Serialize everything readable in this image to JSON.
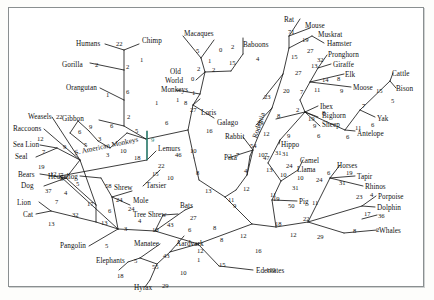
{
  "figure": {
    "kind": "phylogenetic-tree",
    "background": "#ffffff",
    "border_color": "#8a8f90",
    "line_color": "#1a1a1a",
    "highlight_color": "#2e8b7a"
  },
  "chart_data": {
    "type": "diagram",
    "subtype": "phylogram",
    "taxa": [
      "Humans",
      "Chimp",
      "Gorilla",
      "Orangutan",
      "Gibbon",
      "Macaques",
      "Baboons",
      "Old World Monkeys",
      "S. American Monkeys",
      "Loris",
      "Galago",
      "Lemurs",
      "Tarsier",
      "Rabbit",
      "Pika",
      "Rat",
      "Mouse",
      "Muskrat",
      "Hamster",
      "Weasels",
      "Raccoons",
      "Sea Lion",
      "Seal",
      "Bears",
      "Dog",
      "Lion",
      "Cat",
      "Hedgehog",
      "Shrew",
      "Mole",
      "Tree Shrew",
      "Bats",
      "Pangolin",
      "Manatee",
      "Aardvark",
      "Elephants",
      "Hyrax",
      "Edentates",
      "Pronghorn",
      "Giraffe",
      "Elk",
      "Moose",
      "Ibex",
      "Bighorn Sheep",
      "Antelope",
      "Cattle",
      "Bison",
      "Yak",
      "Hippo",
      "Camel",
      "Llama",
      "Pig",
      "Horses",
      "Tapir",
      "Rhinos",
      "Porpoise",
      "Dolphin",
      "Whales"
    ],
    "clade_labels": [
      "Rodentia"
    ],
    "branch_lengths": [
      22,
      1,
      2,
      2,
      6,
      1,
      2,
      6,
      5,
      5,
      0,
      1,
      2,
      2,
      15,
      4,
      0,
      1,
      1,
      8,
      27,
      16,
      6,
      10,
      46,
      22,
      18,
      15,
      10,
      54,
      7,
      107,
      4,
      13,
      8,
      9,
      11,
      12,
      29,
      23,
      20,
      71,
      19,
      15,
      27,
      27,
      32,
      13,
      14,
      8,
      9,
      11,
      7,
      2,
      19,
      8,
      9,
      6,
      6,
      11,
      7,
      15,
      5,
      6,
      47,
      31,
      24,
      10,
      31,
      6,
      19,
      31,
      10,
      23,
      4,
      17,
      36,
      2,
      8,
      29,
      22,
      11,
      24,
      50,
      12,
      18,
      12,
      16,
      110,
      12,
      5,
      55,
      18,
      43,
      29,
      10,
      1,
      12,
      15,
      43,
      27,
      6,
      8,
      10,
      4,
      3,
      13,
      24,
      24,
      58,
      6,
      5,
      17,
      32,
      13,
      7,
      37,
      19,
      12,
      7,
      9,
      5,
      3,
      9,
      6,
      5,
      3,
      10,
      5,
      9,
      12,
      22,
      6,
      1,
      5,
      41
    ]
  },
  "labels": [
    {
      "id": "humans",
      "text": "Humans",
      "x": 76,
      "y": 41
    },
    {
      "id": "chimp",
      "text": "Chimp",
      "x": 142,
      "y": 38
    },
    {
      "id": "macaques",
      "text": "Macaques",
      "x": 184,
      "y": 31
    },
    {
      "id": "baboons",
      "text": "Baboons",
      "x": 243,
      "y": 42
    },
    {
      "id": "gorilla",
      "text": "Gorilla",
      "x": 62,
      "y": 62
    },
    {
      "id": "orangutan",
      "text": "Orangutan",
      "x": 66,
      "y": 85
    },
    {
      "id": "old",
      "text": "Old",
      "x": 170,
      "y": 69
    },
    {
      "id": "world",
      "text": "World",
      "x": 165,
      "y": 78
    },
    {
      "id": "monkeys",
      "text": "Monkeys",
      "x": 161,
      "y": 87
    },
    {
      "id": "gibbon",
      "text": "Gibbon",
      "x": 62,
      "y": 116
    },
    {
      "id": "loris",
      "text": "Loris",
      "x": 201,
      "y": 110
    },
    {
      "id": "galago",
      "text": "Galago",
      "x": 217,
      "y": 120
    },
    {
      "id": "rabbit",
      "text": "Rabbit",
      "x": 225,
      "y": 134
    },
    {
      "id": "pika",
      "text": "Pika",
      "x": 224,
      "y": 155
    },
    {
      "id": "weasels",
      "text": "Weasels",
      "x": 28,
      "y": 114
    },
    {
      "id": "raccoons",
      "text": "Raccoons",
      "x": 13,
      "y": 126
    },
    {
      "id": "sealion",
      "text": "Sea Lion",
      "x": 13,
      "y": 142
    },
    {
      "id": "seal",
      "text": "Seal",
      "x": 15,
      "y": 154
    },
    {
      "id": "bears",
      "text": "Bears",
      "x": 18,
      "y": 172
    },
    {
      "id": "dog",
      "text": "Dog",
      "x": 21,
      "y": 183
    },
    {
      "id": "lion",
      "text": "Lion",
      "x": 17,
      "y": 200
    },
    {
      "id": "cat",
      "text": "Cat",
      "x": 23,
      "y": 212
    },
    {
      "id": "samonkeys",
      "text": "S. American Monkeys",
      "x": 74,
      "y": 150,
      "rotate": -12
    },
    {
      "id": "lemurs",
      "text": "Lemurs",
      "x": 158,
      "y": 146
    },
    {
      "id": "tarsier",
      "text": "Tarsier",
      "x": 146,
      "y": 183
    },
    {
      "id": "hedgehog",
      "text": "Hedgehog",
      "x": 48,
      "y": 174
    },
    {
      "id": "shrew",
      "text": "Shrew",
      "x": 114,
      "y": 185
    },
    {
      "id": "mole",
      "text": "Mole",
      "x": 133,
      "y": 198
    },
    {
      "id": "treeshrew",
      "text": "Tree Shrew",
      "x": 133,
      "y": 212
    },
    {
      "id": "bats",
      "text": "Bats",
      "x": 180,
      "y": 203
    },
    {
      "id": "pangolin",
      "text": "Pangolin",
      "x": 60,
      "y": 243
    },
    {
      "id": "manatee",
      "text": "Manatee",
      "x": 134,
      "y": 241
    },
    {
      "id": "aardvark",
      "text": "Aardvark",
      "x": 176,
      "y": 241
    },
    {
      "id": "elephants",
      "text": "Elephants",
      "x": 96,
      "y": 258
    },
    {
      "id": "hyrax",
      "text": "Hyrax",
      "x": 134,
      "y": 285
    },
    {
      "id": "edentates",
      "text": "Edentates",
      "x": 256,
      "y": 268
    },
    {
      "id": "rodentia",
      "text": "Rodentia",
      "x": 252,
      "y": 137,
      "rotate": -72
    },
    {
      "id": "rat",
      "text": "Rat",
      "x": 284,
      "y": 17
    },
    {
      "id": "mouse",
      "text": "Mouse",
      "x": 305,
      "y": 23
    },
    {
      "id": "muskrat",
      "text": "Muskrat",
      "x": 318,
      "y": 32
    },
    {
      "id": "hamster",
      "text": "Hamster",
      "x": 327,
      "y": 41
    },
    {
      "id": "pronghorn",
      "text": "Pronghorn",
      "x": 328,
      "y": 52
    },
    {
      "id": "giraffe",
      "text": "Giraffe",
      "x": 333,
      "y": 62
    },
    {
      "id": "elk",
      "text": "Elk",
      "x": 345,
      "y": 72
    },
    {
      "id": "moose",
      "text": "Moose",
      "x": 353,
      "y": 85
    },
    {
      "id": "cattle",
      "text": "Cattle",
      "x": 392,
      "y": 71
    },
    {
      "id": "bison",
      "text": "Bison",
      "x": 396,
      "y": 86
    },
    {
      "id": "ibex",
      "text": "Ibex",
      "x": 320,
      "y": 104
    },
    {
      "id": "bighorn",
      "text": "Bighorn",
      "x": 322,
      "y": 113
    },
    {
      "id": "sheep",
      "text": "Sheep",
      "x": 322,
      "y": 122
    },
    {
      "id": "yak",
      "text": "Yak",
      "x": 377,
      "y": 116
    },
    {
      "id": "antelope",
      "text": "Antelope",
      "x": 357,
      "y": 131
    },
    {
      "id": "hippo",
      "text": "Hippo",
      "x": 281,
      "y": 142
    },
    {
      "id": "camel",
      "text": "Camel",
      "x": 300,
      "y": 158
    },
    {
      "id": "llama",
      "text": "Llama",
      "x": 297,
      "y": 167
    },
    {
      "id": "horses",
      "text": "Horses",
      "x": 337,
      "y": 163
    },
    {
      "id": "tapir",
      "text": "Tapir",
      "x": 357,
      "y": 174
    },
    {
      "id": "rhinos",
      "text": "Rhinos",
      "x": 365,
      "y": 184
    },
    {
      "id": "porpoise",
      "text": "Porpoise",
      "x": 378,
      "y": 194
    },
    {
      "id": "dolphin",
      "text": "Dolphin",
      "x": 377,
      "y": 205
    },
    {
      "id": "whales",
      "text": "Whales",
      "x": 379,
      "y": 228
    },
    {
      "id": "pig",
      "text": "Pig",
      "x": 299,
      "y": 199
    }
  ],
  "numbers": [
    {
      "v": "22",
      "x": 116,
      "y": 41
    },
    {
      "v": "1",
      "x": 140,
      "y": 57
    },
    {
      "v": "2",
      "x": 126,
      "y": 64
    },
    {
      "v": "2",
      "x": 95,
      "y": 62
    },
    {
      "v": "6",
      "x": 126,
      "y": 89
    },
    {
      "v": "1",
      "x": 106,
      "y": 92
    },
    {
      "v": "2",
      "x": 127,
      "y": 114
    },
    {
      "v": "6",
      "x": 110,
      "y": 123
    },
    {
      "v": "5",
      "x": 135,
      "y": 128
    },
    {
      "v": "5",
      "x": 196,
      "y": 48
    },
    {
      "v": "0",
      "x": 219,
      "y": 47
    },
    {
      "v": "1",
      "x": 208,
      "y": 58
    },
    {
      "v": "2",
      "x": 231,
      "y": 44
    },
    {
      "v": "4",
      "x": 256,
      "y": 56
    },
    {
      "v": "15",
      "x": 229,
      "y": 60
    },
    {
      "v": "2",
      "x": 197,
      "y": 66
    },
    {
      "v": "2",
      "x": 212,
      "y": 67
    },
    {
      "v": "0",
      "x": 191,
      "y": 76
    },
    {
      "v": "1",
      "x": 192,
      "y": 90
    },
    {
      "v": "1",
      "x": 176,
      "y": 97
    },
    {
      "v": "1",
      "x": 155,
      "y": 100
    },
    {
      "v": "8",
      "x": 184,
      "y": 100
    },
    {
      "v": "27",
      "x": 190,
      "y": 107
    },
    {
      "v": "16",
      "x": 206,
      "y": 128
    },
    {
      "v": "6",
      "x": 165,
      "y": 120
    },
    {
      "v": "9",
      "x": 151,
      "y": 137,
      "color": "#2e8b7a"
    },
    {
      "v": "46",
      "x": 175,
      "y": 152
    },
    {
      "v": "22",
      "x": 158,
      "y": 163
    },
    {
      "v": "18",
      "x": 134,
      "y": 155
    },
    {
      "v": "15",
      "x": 152,
      "y": 171
    },
    {
      "v": "10",
      "x": 167,
      "y": 175
    },
    {
      "v": "10",
      "x": 190,
      "y": 148
    },
    {
      "v": "8",
      "x": 196,
      "y": 170
    },
    {
      "v": "13",
      "x": 205,
      "y": 188
    },
    {
      "v": "54",
      "x": 250,
      "y": 143
    },
    {
      "v": "7",
      "x": 236,
      "y": 152
    },
    {
      "v": "107",
      "x": 258,
      "y": 152
    },
    {
      "v": "4",
      "x": 244,
      "y": 168
    },
    {
      "v": "13",
      "x": 266,
      "y": 167
    },
    {
      "v": "11",
      "x": 228,
      "y": 197
    },
    {
      "v": "12",
      "x": 243,
      "y": 186
    },
    {
      "v": "9",
      "x": 233,
      "y": 203
    },
    {
      "v": "12",
      "x": 240,
      "y": 233
    },
    {
      "v": "16",
      "x": 255,
      "y": 248
    },
    {
      "v": "110",
      "x": 266,
      "y": 267
    },
    {
      "v": "22",
      "x": 56,
      "y": 114
    },
    {
      "v": "12",
      "x": 37,
      "y": 136
    },
    {
      "v": "7",
      "x": 42,
      "y": 149
    },
    {
      "v": "9",
      "x": 63,
      "y": 144
    },
    {
      "v": "19",
      "x": 38,
      "y": 164
    },
    {
      "v": "12",
      "x": 50,
      "y": 171
    },
    {
      "v": "7",
      "x": 60,
      "y": 172
    },
    {
      "v": "37",
      "x": 45,
      "y": 188
    },
    {
      "v": "4",
      "x": 64,
      "y": 190
    },
    {
      "v": "7",
      "x": 55,
      "y": 199
    },
    {
      "v": "32",
      "x": 72,
      "y": 212
    },
    {
      "v": "13",
      "x": 48,
      "y": 221
    },
    {
      "v": "17",
      "x": 87,
      "y": 201
    },
    {
      "v": "5",
      "x": 76,
      "y": 181
    },
    {
      "v": "13",
      "x": 101,
      "y": 220
    },
    {
      "v": "3",
      "x": 124,
      "y": 226
    },
    {
      "v": "58",
      "x": 105,
      "y": 183
    },
    {
      "v": "24",
      "x": 116,
      "y": 197
    },
    {
      "v": "24",
      "x": 128,
      "y": 206
    },
    {
      "v": "6",
      "x": 108,
      "y": 208
    },
    {
      "v": "4",
      "x": 138,
      "y": 218
    },
    {
      "v": "10",
      "x": 152,
      "y": 227
    },
    {
      "v": "43",
      "x": 167,
      "y": 222
    },
    {
      "v": "27",
      "x": 190,
      "y": 215
    },
    {
      "v": "6",
      "x": 188,
      "y": 227
    },
    {
      "v": "8",
      "x": 213,
      "y": 225
    },
    {
      "v": "9",
      "x": 89,
      "y": 124
    },
    {
      "v": "6",
      "x": 78,
      "y": 129
    },
    {
      "v": "3",
      "x": 98,
      "y": 136
    },
    {
      "v": "5",
      "x": 84,
      "y": 142
    },
    {
      "v": "3",
      "x": 106,
      "y": 152
    },
    {
      "v": "10",
      "x": 120,
      "y": 148
    },
    {
      "v": "5",
      "x": 105,
      "y": 243
    },
    {
      "v": "5",
      "x": 134,
      "y": 258
    },
    {
      "v": "18",
      "x": 117,
      "y": 273
    },
    {
      "v": "55",
      "x": 152,
      "y": 264
    },
    {
      "v": "43",
      "x": 163,
      "y": 253
    },
    {
      "v": "29",
      "x": 162,
      "y": 283
    },
    {
      "v": "10",
      "x": 180,
      "y": 270
    },
    {
      "v": "12",
      "x": 197,
      "y": 248
    },
    {
      "v": "1",
      "x": 197,
      "y": 257
    },
    {
      "v": "15",
      "x": 219,
      "y": 262
    },
    {
      "v": "8",
      "x": 220,
      "y": 237
    },
    {
      "v": "71",
      "x": 288,
      "y": 29
    },
    {
      "v": "19",
      "x": 302,
      "y": 37
    },
    {
      "v": "15",
      "x": 291,
      "y": 54
    },
    {
      "v": "27",
      "x": 307,
      "y": 48
    },
    {
      "v": "27",
      "x": 295,
      "y": 70
    },
    {
      "v": "32",
      "x": 317,
      "y": 57
    },
    {
      "v": "13",
      "x": 311,
      "y": 63
    },
    {
      "v": "14",
      "x": 322,
      "y": 77
    },
    {
      "v": "8",
      "x": 337,
      "y": 76
    },
    {
      "v": "9",
      "x": 340,
      "y": 88
    },
    {
      "v": "11",
      "x": 314,
      "y": 87
    },
    {
      "v": "7",
      "x": 300,
      "y": 89
    },
    {
      "v": "20",
      "x": 283,
      "y": 88
    },
    {
      "v": "23",
      "x": 264,
      "y": 94
    },
    {
      "v": "29",
      "x": 257,
      "y": 120
    },
    {
      "v": "8",
      "x": 277,
      "y": 113
    },
    {
      "v": "12",
      "x": 263,
      "y": 131
    },
    {
      "v": "2",
      "x": 296,
      "y": 107
    },
    {
      "v": "19",
      "x": 308,
      "y": 116
    },
    {
      "v": "8",
      "x": 322,
      "y": 110
    },
    {
      "v": "9",
      "x": 313,
      "y": 123
    },
    {
      "v": "6",
      "x": 317,
      "y": 133
    },
    {
      "v": "9",
      "x": 287,
      "y": 133
    },
    {
      "v": "15",
      "x": 376,
      "y": 88
    },
    {
      "v": "5",
      "x": 391,
      "y": 98
    },
    {
      "v": "7",
      "x": 362,
      "y": 103
    },
    {
      "v": "11",
      "x": 355,
      "y": 125
    },
    {
      "v": "6",
      "x": 371,
      "y": 122
    },
    {
      "v": "6",
      "x": 346,
      "y": 134
    },
    {
      "v": "47",
      "x": 263,
      "y": 155
    },
    {
      "v": "31",
      "x": 275,
      "y": 150
    },
    {
      "v": "24",
      "x": 286,
      "y": 163
    },
    {
      "v": "10",
      "x": 297,
      "y": 175
    },
    {
      "v": "10",
      "x": 280,
      "y": 172
    },
    {
      "v": "31",
      "x": 292,
      "y": 185
    },
    {
      "v": "31",
      "x": 282,
      "y": 151
    },
    {
      "v": "24",
      "x": 316,
      "y": 177
    },
    {
      "v": "6",
      "x": 327,
      "y": 170
    },
    {
      "v": "19",
      "x": 346,
      "y": 170
    },
    {
      "v": "31",
      "x": 339,
      "y": 180
    },
    {
      "v": "23",
      "x": 356,
      "y": 194
    },
    {
      "v": "4",
      "x": 370,
      "y": 192
    },
    {
      "v": "17",
      "x": 364,
      "y": 211
    },
    {
      "v": "36",
      "x": 378,
      "y": 213
    },
    {
      "v": "2",
      "x": 376,
      "y": 227
    },
    {
      "v": "8",
      "x": 353,
      "y": 228
    },
    {
      "v": "29",
      "x": 317,
      "y": 234
    },
    {
      "v": "22",
      "x": 303,
      "y": 216
    },
    {
      "v": "11",
      "x": 312,
      "y": 200
    },
    {
      "v": "50",
      "x": 288,
      "y": 203
    },
    {
      "v": "19",
      "x": 273,
      "y": 196
    },
    {
      "v": "18",
      "x": 275,
      "y": 221
    },
    {
      "v": "12",
      "x": 290,
      "y": 232
    },
    {
      "v": "11",
      "x": 270,
      "y": 192
    }
  ]
}
